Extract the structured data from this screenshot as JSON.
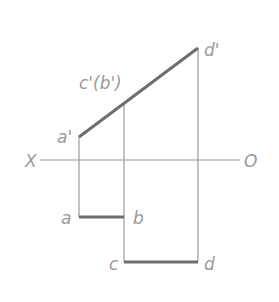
{
  "diagram": {
    "type": "orthographic-projection-of-line",
    "axis": {
      "left_label": "X",
      "right_label": "O"
    },
    "front_view": {
      "points": {
        "a_prime": {
          "label": "a'",
          "x": 79,
          "y": 136
        },
        "c_prime_b_prime": {
          "label": "c'(b')",
          "x": 124,
          "y": 103
        },
        "d_prime": {
          "label": "d'",
          "x": 198,
          "y": 48
        }
      }
    },
    "top_view": {
      "points": {
        "a": {
          "label": "a",
          "x": 79,
          "y": 217
        },
        "b": {
          "label": "b",
          "x": 124,
          "y": 217
        },
        "c": {
          "label": "c",
          "x": 124,
          "y": 262
        },
        "d": {
          "label": "d",
          "x": 198,
          "y": 262
        }
      }
    },
    "colors": {
      "thick_line": "#6e6e6e",
      "thin_line": "#9a9a9a",
      "label": "#9a9a9a"
    }
  }
}
